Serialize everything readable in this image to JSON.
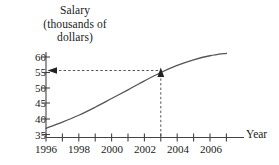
{
  "chart_data": {
    "type": "line",
    "title": "",
    "ylabel_lines": [
      "Salary",
      "(thousands of",
      "dollars)"
    ],
    "xlabel": "Year",
    "xlim": [
      1996,
      2007
    ],
    "ylim": [
      35,
      62
    ],
    "grid": false,
    "legend": "none",
    "x_major_ticks": [
      1996,
      1998,
      2000,
      2002,
      2004,
      2006
    ],
    "x_major_tick_labels": [
      "1996",
      "1998",
      "2000",
      "2002",
      "2004",
      "2006"
    ],
    "x_minor_ticks": [
      1997,
      1999,
      2001,
      2003,
      2005,
      2007
    ],
    "y_ticks": [
      35,
      40,
      45,
      50,
      55,
      60
    ],
    "y_tick_labels": [
      "35",
      "40",
      "45",
      "50",
      "55",
      "60"
    ],
    "series": [
      {
        "name": "Salary",
        "x": [
          1996,
          1997,
          1998,
          1999,
          2000,
          2001,
          2002,
          2003,
          2004,
          2005,
          2006,
          2007
        ],
        "values": [
          37.0,
          39.0,
          41.2,
          43.8,
          46.6,
          49.4,
          52.3,
          55.0,
          57.3,
          59.1,
          60.4,
          61.2
        ]
      }
    ],
    "annotations": [
      {
        "name": "readoff-vertical",
        "kind": "dashed-arrow",
        "from": [
          2003,
          35
        ],
        "to": [
          2003,
          55
        ],
        "arrow": "up",
        "label": ""
      },
      {
        "name": "readoff-horizontal",
        "kind": "dashed-arrow",
        "from": [
          2003,
          55
        ],
        "to": [
          1996,
          55
        ],
        "arrow": "left",
        "label": ""
      }
    ],
    "marked_point": {
      "x": 2003,
      "y": 55
    },
    "colors": {
      "curve": "#555555",
      "axis": "#444444",
      "dashed": "#555555",
      "text": "#1a1a1a",
      "background": "#ffffff"
    }
  }
}
